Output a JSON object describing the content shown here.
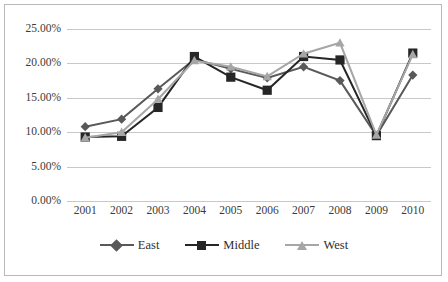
{
  "chart_data": {
    "type": "line",
    "title": "",
    "xlabel": "",
    "ylabel": "",
    "categories": [
      "2001",
      "2002",
      "2003",
      "2004",
      "2005",
      "2006",
      "2007",
      "2008",
      "2009",
      "2010"
    ],
    "ylim": [
      0,
      25
    ],
    "ytick_labels": [
      "0.00%",
      "5.00%",
      "10.00%",
      "15.00%",
      "20.00%",
      "25.00%"
    ],
    "ytick_values": [
      0,
      5,
      10,
      15,
      20,
      25
    ],
    "grid": true,
    "legend_position": "bottom",
    "series": [
      {
        "name": "East",
        "marker": "diamond",
        "color": "#595959",
        "values": [
          10.8,
          11.9,
          16.3,
          20.6,
          19.2,
          17.9,
          19.5,
          17.5,
          9.5,
          18.3
        ]
      },
      {
        "name": "Middle",
        "marker": "square",
        "color": "#262626",
        "values": [
          9.3,
          9.4,
          13.6,
          21.0,
          18.0,
          16.1,
          21.0,
          20.5,
          9.5,
          21.5
        ]
      },
      {
        "name": "West",
        "marker": "triangle",
        "color": "#a6a6a6",
        "values": [
          9.2,
          10.0,
          14.8,
          20.4,
          19.5,
          18.1,
          21.4,
          23.0,
          9.6,
          21.3
        ]
      }
    ]
  },
  "colors": {
    "gridline": "#c8c8c8",
    "border": "#b9b9b9",
    "axis_text": "#3b3b3b",
    "background": "#ffffff"
  }
}
